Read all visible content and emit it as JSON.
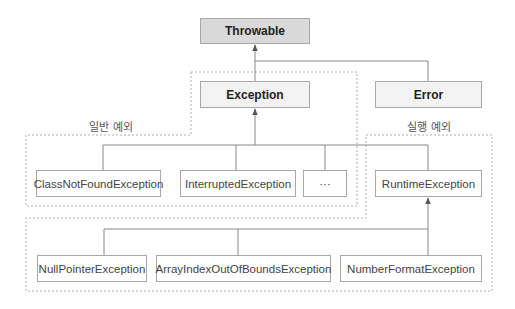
{
  "diagram": {
    "type": "class-hierarchy",
    "nodes": {
      "throwable": {
        "label": "Throwable",
        "style": "root"
      },
      "exception": {
        "label": "Exception",
        "style": "mid"
      },
      "error": {
        "label": "Error",
        "style": "mid"
      },
      "class_not_found": {
        "label": "ClassNotFoundException",
        "style": "leaf"
      },
      "interrupted": {
        "label": "InterruptedException",
        "style": "leaf"
      },
      "ellipsis": {
        "label": "···",
        "style": "leaf"
      },
      "runtime": {
        "label": "RuntimeException",
        "style": "leaf"
      },
      "null_pointer": {
        "label": "NullPointerException",
        "style": "leaf"
      },
      "array_index": {
        "label": "ArrayIndexOutOfBoundsException",
        "style": "leaf"
      },
      "number_format": {
        "label": "NumberFormatException",
        "style": "leaf"
      }
    },
    "edges": [
      {
        "from": "exception",
        "to": "throwable"
      },
      {
        "from": "error",
        "to": "throwable"
      },
      {
        "from": "class_not_found",
        "to": "exception"
      },
      {
        "from": "interrupted",
        "to": "exception"
      },
      {
        "from": "ellipsis",
        "to": "exception"
      },
      {
        "from": "runtime",
        "to": "exception"
      },
      {
        "from": "null_pointer",
        "to": "runtime"
      },
      {
        "from": "array_index",
        "to": "runtime"
      },
      {
        "from": "number_format",
        "to": "runtime"
      }
    ],
    "groups": {
      "general": {
        "label": "일반 예외"
      },
      "runtime": {
        "label": "실행 예외"
      }
    },
    "colors": {
      "root_fill": "#d9d9d9",
      "mid_fill": "#f3f3f3",
      "leaf_fill": "#ffffff",
      "border": "#a8a8a8",
      "line": "#888888",
      "dashed": "#b0b0b0"
    }
  }
}
